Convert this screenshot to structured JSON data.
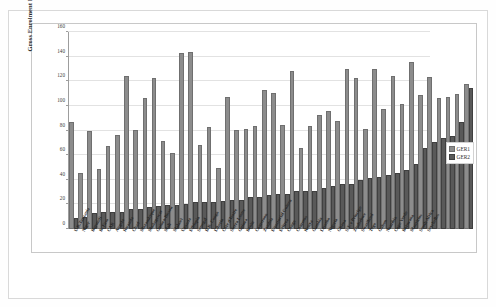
{
  "chart_data": {
    "type": "bar",
    "title": "",
    "xlabel": "",
    "ylabel": "Gross Enrolment R",
    "ylim": [
      0,
      160
    ],
    "yticks": [
      0,
      20,
      40,
      60,
      80,
      100,
      120,
      140,
      160
    ],
    "grid": true,
    "legend_position": "right",
    "colors": {
      "GER1": "#8c8c8c",
      "GER2": "#595959",
      "gridline": "#e2e2e2",
      "axis": "#9d9d9d",
      "frame": "#d9d9d9",
      "text": "#262626"
    },
    "categories": [
      "U.R.Tanzania",
      "Niger",
      "Burundi",
      "B. Faso",
      "CAR",
      "Angola",
      "Rwanda",
      "Chad",
      "Mozambique",
      "Madagascar",
      "Guinea-Bissau",
      "Mali",
      "Malawi",
      "Uganda",
      "Ethiopia",
      "Senegal",
      "D.R. Congo",
      "Liberia",
      "Côte d'Ivoire",
      "Sierra Leone",
      "Guinea",
      "Benin",
      "Cameroon",
      "Zambia",
      "Equatorial Guinea",
      "Eritrea",
      "Congo",
      "Comoros",
      "Kenya",
      "Gambia",
      "Lesotho",
      "Nigeria",
      "Ghana",
      "S.T. e Principe",
      "Zimbabwe",
      "Swaziland",
      "Togo",
      "Gabon",
      "Namibia",
      "Cape Verde",
      "Botswana",
      "Mauritius",
      "South Africa",
      "Seychelles"
    ],
    "series": [
      {
        "name": "GER1",
        "color": "#8c8c8c",
        "values": [
          85,
          44,
          78,
          47,
          66,
          75,
          123,
          79,
          105,
          121,
          70,
          60,
          141,
          142,
          67,
          81,
          48,
          106,
          79,
          80,
          82,
          111,
          109,
          83,
          127,
          64,
          82,
          91,
          94,
          86,
          128,
          121,
          80,
          128,
          96,
          123,
          100,
          134,
          107,
          122,
          105,
          106,
          108,
          116
        ]
      },
      {
        "name": "GER2",
        "color": "#595959",
        "values": [
          7,
          8,
          11,
          12,
          12,
          12,
          15,
          15,
          16,
          17,
          18,
          18,
          19,
          20,
          20,
          20,
          21,
          22,
          22,
          24,
          24,
          26,
          27,
          27,
          29,
          29,
          29,
          32,
          33,
          35,
          35,
          38,
          40,
          41,
          42,
          44,
          46,
          51,
          64,
          69,
          72,
          74,
          85,
          113
        ]
      }
    ]
  },
  "legend": {
    "items": [
      {
        "label": "GER1"
      },
      {
        "label": "GER2"
      }
    ]
  }
}
